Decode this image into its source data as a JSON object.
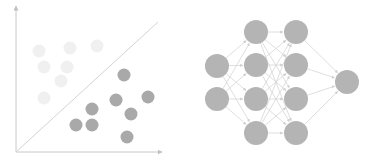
{
  "colors": {
    "background": "#ffffff",
    "axis": "#c8c8c8",
    "divider": "#d4d4d4",
    "point_dark": "#a9a9a9",
    "point_light": "#f0f0f0",
    "node": "#b4b4b4",
    "edge": "#d6d6d6"
  },
  "scatter": {
    "origin": [
      16,
      152
    ],
    "x_axis_end": [
      162,
      152
    ],
    "y_axis_end": [
      16,
      6
    ],
    "divider": [
      [
        16,
        152
      ],
      [
        158,
        22
      ]
    ],
    "point_radius": 6.5,
    "dark_points": [
      [
        124,
        75
      ],
      [
        116,
        100
      ],
      [
        148,
        97
      ],
      [
        131,
        114
      ],
      [
        92,
        109
      ],
      [
        76,
        125
      ],
      [
        92,
        125
      ],
      [
        127,
        137
      ]
    ],
    "light_points": [
      [
        39,
        51
      ],
      [
        70,
        48
      ],
      [
        97,
        46
      ],
      [
        44,
        67
      ],
      [
        67,
        67
      ],
      [
        61,
        81
      ],
      [
        44,
        98
      ]
    ]
  },
  "network": {
    "node_radius": 12,
    "layers": [
      [
        [
          217,
          66
        ],
        [
          217,
          99
        ]
      ],
      [
        [
          256,
          32
        ],
        [
          256,
          65
        ],
        [
          256,
          99
        ],
        [
          256,
          133
        ]
      ],
      [
        [
          296,
          32
        ],
        [
          296,
          65
        ],
        [
          296,
          99
        ],
        [
          296,
          133
        ]
      ],
      [
        [
          347,
          82
        ]
      ]
    ]
  }
}
